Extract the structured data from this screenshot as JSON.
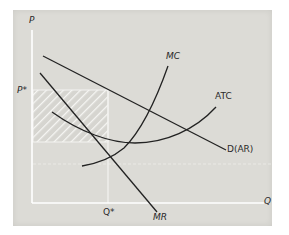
{
  "diagram": {
    "background_color": "#dcdbd6",
    "line_color": "#222222",
    "axis_color": "#ffffff",
    "axes": {
      "y_label": "P",
      "x_label": "Q"
    },
    "markers": {
      "price_label": "P*",
      "quantity_label": "Q*"
    },
    "curves": [
      {
        "id": "demand",
        "label": "D(AR)"
      },
      {
        "id": "marginal-revenue",
        "label": "MR"
      },
      {
        "id": "marginal-cost",
        "label": "MC"
      },
      {
        "id": "average-total-cost",
        "label": "ATC"
      }
    ],
    "shaded_region": {
      "meaning": "economic profit",
      "pattern": "diagonal-hatch"
    }
  }
}
